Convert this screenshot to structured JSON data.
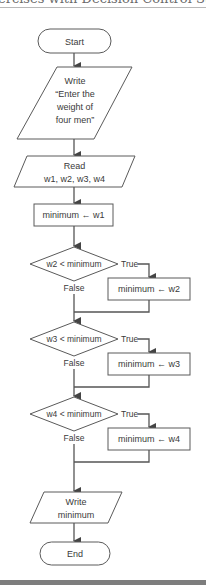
{
  "header": {
    "text": "ercises with Decision Control Structu"
  },
  "flowchart": {
    "start": {
      "label": "Start"
    },
    "write_prompt": {
      "lines": [
        "Write",
        "“Enter the",
        "weight of",
        "four men”"
      ]
    },
    "read": {
      "lines": [
        "Read",
        "w1, w2, w3, w4"
      ]
    },
    "assign_init": {
      "label": "minimum ← w1"
    },
    "decisions": [
      {
        "condition": "w2 < minimum",
        "true_label": "True",
        "false_label": "False",
        "action": "minimum ← w2"
      },
      {
        "condition": "w3 < minimum",
        "true_label": "True",
        "false_label": "False",
        "action": "minimum ← w3"
      },
      {
        "condition": "w4 < minimum",
        "true_label": "True",
        "false_label": "False",
        "action": "minimum ← w4"
      }
    ],
    "write_result": {
      "lines": [
        "Write",
        "minimum"
      ]
    },
    "end": {
      "label": "End"
    }
  },
  "colors": {
    "stroke": "#5a5a5a",
    "text": "#3a3a3a",
    "bottom_bar": "#7d7d7d"
  }
}
